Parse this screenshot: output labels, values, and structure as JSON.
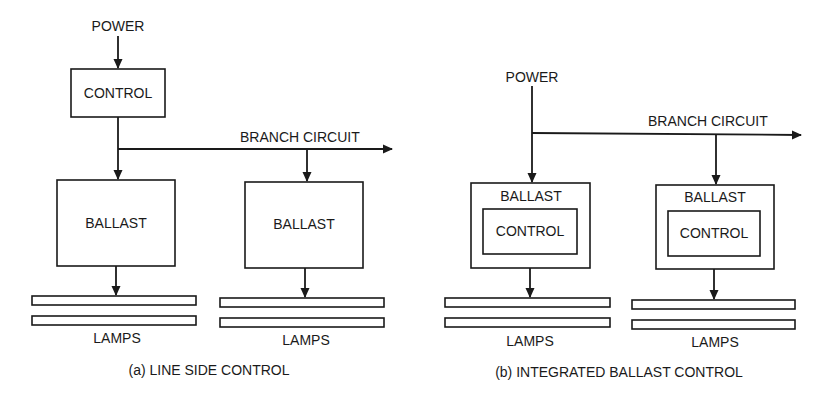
{
  "figure": {
    "panel_a": {
      "caption": "(a) LINE SIDE CONTROL",
      "power_label": "POWER",
      "control_label": "CONTROL",
      "branch_label": "BRANCH CIRCUIT",
      "ballasts": [
        {
          "label": "BALLAST",
          "lamps_label": "LAMPS"
        },
        {
          "label": "BALLAST",
          "lamps_label": "LAMPS"
        }
      ]
    },
    "panel_b": {
      "caption": "(b) INTEGRATED BALLAST CONTROL",
      "power_label": "POWER",
      "branch_label": "BRANCH CIRCUIT",
      "ballasts": [
        {
          "label": "BALLAST",
          "control_label": "CONTROL",
          "lamps_label": "LAMPS"
        },
        {
          "label": "BALLAST",
          "control_label": "CONTROL",
          "lamps_label": "LAMPS"
        }
      ]
    },
    "colors": {
      "ink": "#1a1a1a",
      "background": "#ffffff"
    }
  }
}
